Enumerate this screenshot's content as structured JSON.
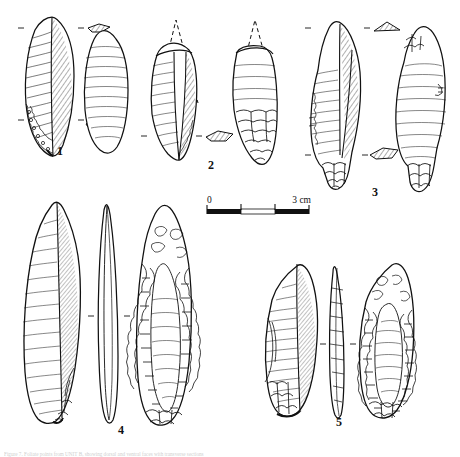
{
  "plate": {
    "background_color": "#ffffff",
    "ink_color": "#111111",
    "caption_text": "Figure 7. Foliate points from UNIT B, showing dorsal and ventral faces with transverse sections"
  },
  "scale_bar": {
    "label_start": "0",
    "label_end": "3 cm",
    "segments": [
      "black",
      "white",
      "black"
    ],
    "units": "cm",
    "total_length_cm": 3
  },
  "artifacts": [
    {
      "number": "1",
      "label": "1",
      "views": [
        "dorsal",
        "ventral"
      ],
      "sections": 2,
      "description": "leaf-shaped foliate point, complete"
    },
    {
      "number": "2",
      "label": "2",
      "views": [
        "dorsal",
        "ventral"
      ],
      "sections": 1,
      "description": "broken foliate point with reconstructed tip shown in dashed outline"
    },
    {
      "number": "3",
      "label": "3",
      "views": [
        "dorsal",
        "ventral"
      ],
      "sections": 2,
      "description": "stemmed foliate point with basal tang"
    },
    {
      "number": "4",
      "label": "4",
      "views": [
        "ventral",
        "edge profile",
        "dorsal"
      ],
      "sections": 0,
      "description": "large elongated foliate point, bifacially retouched"
    },
    {
      "number": "5",
      "label": "5",
      "views": [
        "ventral",
        "edge profile",
        "dorsal"
      ],
      "sections": 0,
      "description": "foliate point with steep marginal retouch"
    }
  ]
}
